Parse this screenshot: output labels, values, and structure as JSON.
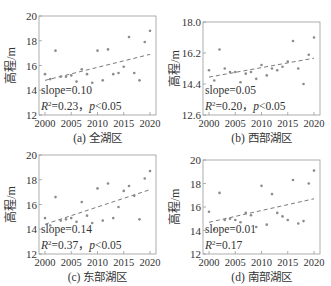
{
  "figure": {
    "ylabel": "高程/m"
  },
  "chart_data": [
    {
      "id": "a",
      "type": "scatter",
      "caption": "(a) 全湖区",
      "xlabel": "",
      "ylabel": "高程/m",
      "xlim": [
        2000,
        2020
      ],
      "ylim": [
        12,
        20
      ],
      "xticks": [
        "2000",
        "2005",
        "2010",
        "2015",
        "2020"
      ],
      "yticks": [
        "12",
        "14",
        "16",
        "18",
        "20"
      ],
      "ytick_values": [
        12,
        14,
        16,
        18,
        20
      ],
      "x": [
        2000,
        2001,
        2002,
        2003,
        2004,
        2005,
        2006,
        2007,
        2008,
        2009,
        2010,
        2011,
        2012,
        2013,
        2014,
        2015,
        2016,
        2017,
        2018,
        2019,
        2020
      ],
      "values": [
        15.3,
        14.9,
        17.2,
        15.1,
        15.1,
        15.2,
        14.7,
        15.7,
        15.3,
        14.6,
        17.2,
        14.8,
        17.3,
        15.3,
        15.4,
        15.9,
        18.3,
        15.4,
        14.8,
        17.9,
        18.8
      ],
      "trend": {
        "x": [
          2000,
          2020
        ],
        "y": [
          14.8,
          16.9
        ],
        "style": "dashed"
      },
      "annotations": [
        "slope=0.10",
        "R²=0.23，p<0.05"
      ]
    },
    {
      "id": "b",
      "type": "scatter",
      "caption": "(b) 西部湖区",
      "xlabel": "",
      "ylabel": "高程/m",
      "xlim": [
        2000,
        2020
      ],
      "ylim": [
        12.6,
        18.0
      ],
      "xticks": [
        "2000",
        "2005",
        "2010",
        "2015",
        "2020"
      ],
      "yticks": [
        "12.6",
        "14.4",
        "16.2",
        "18.0"
      ],
      "ytick_values": [
        12.6,
        14.4,
        16.2,
        18.0
      ],
      "x": [
        2000,
        2001,
        2002,
        2003,
        2004,
        2005,
        2006,
        2007,
        2008,
        2009,
        2010,
        2011,
        2012,
        2013,
        2014,
        2015,
        2016,
        2017,
        2018,
        2019,
        2020
      ],
      "values": [
        15.2,
        14.6,
        16.4,
        15.3,
        15.1,
        15.1,
        14.5,
        15.0,
        15.1,
        14.7,
        15.5,
        14.9,
        15.3,
        15.2,
        15.4,
        15.7,
        16.9,
        15.3,
        14.4,
        16.1,
        17.1
      ],
      "trend": {
        "x": [
          2000,
          2020
        ],
        "y": [
          14.8,
          15.9
        ],
        "style": "dashed"
      },
      "annotations": [
        "slope=0.05",
        "R²=0.20，p<0.05"
      ]
    },
    {
      "id": "c",
      "type": "scatter",
      "caption": "(c) 东部湖区",
      "xlabel": "",
      "ylabel": "高程/m",
      "xlim": [
        2000,
        2020
      ],
      "ylim": [
        12,
        20
      ],
      "xticks": [
        "2000",
        "2005",
        "2010",
        "2015",
        "2020"
      ],
      "yticks": [
        "12",
        "14",
        "16",
        "18",
        "20"
      ],
      "ytick_values": [
        12,
        14,
        16,
        18,
        20
      ],
      "x": [
        2000,
        2001,
        2002,
        2003,
        2004,
        2005,
        2006,
        2007,
        2008,
        2009,
        2010,
        2011,
        2012,
        2013,
        2014,
        2015,
        2016,
        2017,
        2018,
        2019,
        2020
      ],
      "values": [
        14.9,
        14.3,
        16.6,
        14.7,
        14.8,
        14.9,
        14.6,
        16.2,
        15.1,
        14.5,
        17.3,
        14.7,
        17.7,
        14.9,
        15.8,
        17.1,
        17.5,
        16.7,
        14.8,
        18.1,
        18.7
      ],
      "trend": {
        "x": [
          2000,
          2020
        ],
        "y": [
          14.4,
          17.2
        ],
        "style": "dashed"
      },
      "annotations": [
        "slope=0.14",
        "R²=0.37，p<0.05"
      ]
    },
    {
      "id": "d",
      "type": "scatter",
      "caption": "(d) 南部湖区",
      "xlabel": "",
      "ylabel": "高程/m",
      "xlim": [
        2000,
        2020
      ],
      "ylim": [
        12,
        20
      ],
      "xticks": [
        "2000",
        "2005",
        "2010",
        "2015",
        "2020"
      ],
      "yticks": [
        "12",
        "14",
        "16",
        "18",
        "20"
      ],
      "ytick_values": [
        12,
        14,
        16,
        18,
        20
      ],
      "x": [
        2000,
        2001,
        2002,
        2003,
        2004,
        2005,
        2006,
        2007,
        2008,
        2009,
        2010,
        2011,
        2012,
        2013,
        2014,
        2015,
        2016,
        2017,
        2018,
        2019,
        2020
      ],
      "values": [
        15.6,
        14.1,
        17.2,
        14.9,
        15.0,
        14.9,
        14.7,
        15.5,
        15.3,
        14.3,
        17.8,
        14.5,
        17.1,
        15.5,
        15.2,
        14.9,
        18.3,
        14.6,
        14.8,
        18.0,
        19.1
      ],
      "trend": {
        "x": [
          2000,
          2020
        ],
        "y": [
          14.7,
          16.7
        ],
        "style": "dashed"
      },
      "annotations": [
        "slope=0.01",
        "R²=0.17"
      ]
    }
  ],
  "colors": {
    "axis": "#9a9a9a",
    "points": "#8c8c8c",
    "trend": "#7a7a7a",
    "text": "#333333"
  }
}
